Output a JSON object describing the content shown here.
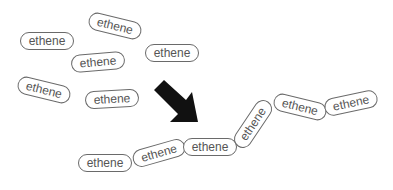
{
  "diagram": {
    "type": "polymerization",
    "arrow_color": "#111111",
    "border_color": "#6a6a6a",
    "text_color": "#555555",
    "monomers": [
      {
        "label": "ethene",
        "cx": 47,
        "cy": 41,
        "rot": 0
      },
      {
        "label": "ethene",
        "cx": 115,
        "cy": 26,
        "rot": 14
      },
      {
        "label": "ethene",
        "cx": 172,
        "cy": 53,
        "rot": 0
      },
      {
        "label": "ethene",
        "cx": 98,
        "cy": 62,
        "rot": -5
      },
      {
        "label": "ethene",
        "cx": 44,
        "cy": 90,
        "rot": 14
      },
      {
        "label": "ethene",
        "cx": 112,
        "cy": 99,
        "rot": -3
      }
    ],
    "polymer_chain": [
      {
        "label": "ethene",
        "cx": 105,
        "cy": 163,
        "rot": 0
      },
      {
        "label": "ethene",
        "cx": 159,
        "cy": 153,
        "rot": -16
      },
      {
        "label": "ethene",
        "cx": 210,
        "cy": 147,
        "rot": 0
      },
      {
        "label": "ethene",
        "cx": 253,
        "cy": 124,
        "rot": -56
      },
      {
        "label": "ethene",
        "cx": 300,
        "cy": 107,
        "rot": 14
      },
      {
        "label": "ethene",
        "cx": 351,
        "cy": 103,
        "rot": -12
      }
    ]
  }
}
